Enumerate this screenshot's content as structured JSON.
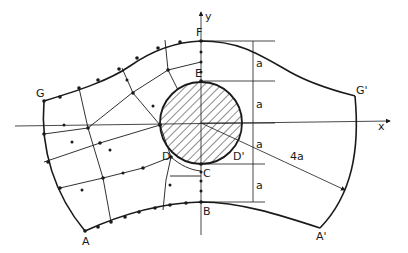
{
  "diagram": {
    "type": "mesh-geometry",
    "points": {
      "A": "A",
      "A_prime": "A'",
      "B": "B",
      "C": "C",
      "D": "D",
      "D_prime": "D'",
      "E": "E",
      "F": "F",
      "G": "G",
      "G_prime": "G'"
    },
    "axes": {
      "x": "x",
      "y": "y"
    },
    "dimensions": {
      "d1": "a",
      "d2": "a",
      "d3": "a",
      "d4": "a",
      "radius": "4a"
    },
    "colors": {
      "ink": "#1a1a1a",
      "background": "#ffffff"
    }
  }
}
